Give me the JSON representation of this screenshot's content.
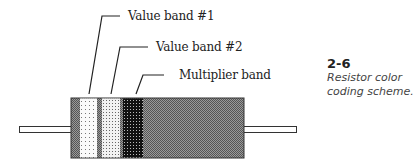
{
  "figure": {
    "number": "2-6",
    "caption": "Resistor color coding scheme."
  },
  "labels": {
    "value_band_1": "Value band #1",
    "value_band_2": "Value band #2",
    "multiplier_band": "Multiplier band"
  },
  "resistor": {
    "body_pattern": "dark-gray-dither",
    "bands": [
      {
        "name": "Value band #1",
        "pattern": "white-dotted"
      },
      {
        "name": "Value band #2",
        "pattern": "light-gray-dotted"
      },
      {
        "name": "Multiplier band",
        "pattern": "black-dotted"
      }
    ]
  }
}
